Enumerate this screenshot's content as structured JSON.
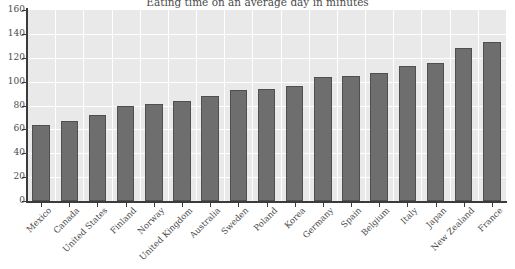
{
  "chart_data": {
    "type": "bar",
    "title": "Eating time on an average day in minutes",
    "xlabel": "",
    "ylabel": "",
    "ylim": [
      0,
      160
    ],
    "yticks": [
      0,
      20,
      40,
      60,
      80,
      100,
      120,
      140,
      160
    ],
    "grid": true,
    "legend_position": "none",
    "bar_color": "#6e6e6e",
    "bar_edge_color": "#4f4f4f",
    "plot_background": "#e9e9e9",
    "gridline_color": "#ffffff",
    "axis_color": "#3b3b3b",
    "text_color": "#4a4a4a",
    "categories": [
      "Mexico",
      "Canada",
      "United States",
      "Finland",
      "Norway",
      "United Kingdom",
      "Australia",
      "Sweden",
      "Poland",
      "Korea",
      "Germany",
      "Spain",
      "Belgium",
      "Italy",
      "Japan",
      "New Zealand",
      "France"
    ],
    "values": [
      64,
      67,
      72,
      80,
      81,
      84,
      88,
      93,
      94,
      96,
      104,
      105,
      107,
      113,
      116,
      128,
      133
    ]
  }
}
